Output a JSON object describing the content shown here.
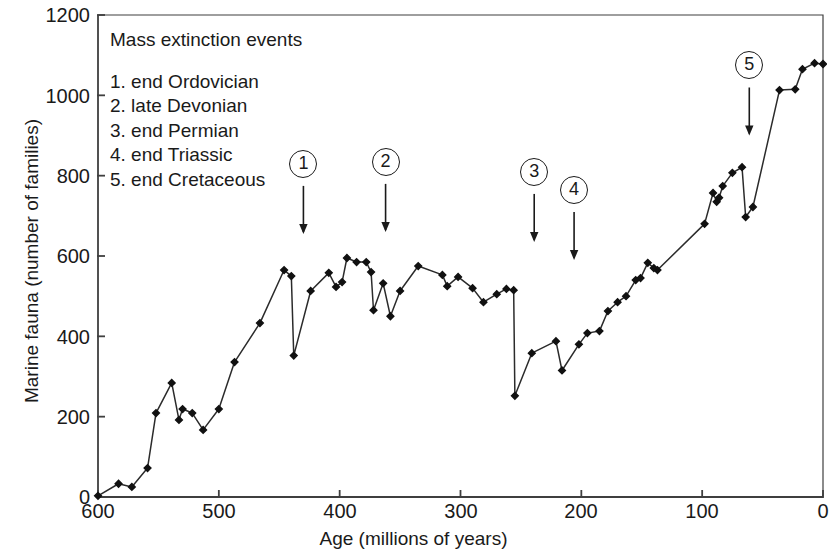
{
  "chart_data": {
    "type": "line",
    "title": "",
    "xlabel": "Age (millions of years)",
    "ylabel": "Marine fauna (number of families)",
    "xlim": [
      600,
      0
    ],
    "ylim": [
      0,
      1200
    ],
    "x_ticks": [
      600,
      500,
      400,
      300,
      200,
      100,
      0
    ],
    "y_ticks": [
      0,
      200,
      400,
      600,
      800,
      1000,
      1200
    ],
    "x_axis_reversed": true,
    "grid": false,
    "legend_position": "none",
    "marker": "diamond",
    "series": [
      {
        "name": "Marine fauna family diversity",
        "points": [
          [
            600,
            3
          ],
          [
            583,
            33
          ],
          [
            572,
            25
          ],
          [
            559,
            72
          ],
          [
            552,
            209
          ],
          [
            539,
            284
          ],
          [
            533,
            192
          ],
          [
            530,
            219
          ],
          [
            522,
            209
          ],
          [
            513,
            167
          ],
          [
            500,
            219
          ],
          [
            487,
            336
          ],
          [
            466,
            433
          ],
          [
            446,
            565
          ],
          [
            440,
            550
          ],
          [
            438,
            352
          ],
          [
            424,
            513
          ],
          [
            409,
            558
          ],
          [
            403,
            523
          ],
          [
            398,
            535
          ],
          [
            394,
            595
          ],
          [
            386,
            585
          ],
          [
            378,
            585
          ],
          [
            374,
            560
          ],
          [
            372,
            465
          ],
          [
            364,
            532
          ],
          [
            358,
            450
          ],
          [
            350,
            513
          ],
          [
            335,
            575
          ],
          [
            315,
            553
          ],
          [
            311,
            525
          ],
          [
            302,
            548
          ],
          [
            290,
            520
          ],
          [
            281,
            485
          ],
          [
            270,
            505
          ],
          [
            262,
            518
          ],
          [
            256,
            515
          ],
          [
            255,
            252
          ],
          [
            241,
            358
          ],
          [
            221,
            388
          ],
          [
            216,
            315
          ],
          [
            202,
            380
          ],
          [
            195,
            408
          ],
          [
            185,
            413
          ],
          [
            178,
            463
          ],
          [
            170,
            485
          ],
          [
            163,
            500
          ],
          [
            155,
            540
          ],
          [
            151,
            545
          ],
          [
            145,
            583
          ],
          [
            140,
            570
          ],
          [
            137,
            565
          ],
          [
            98,
            680
          ],
          [
            91,
            757
          ],
          [
            88,
            735
          ],
          [
            86,
            745
          ],
          [
            83,
            774
          ],
          [
            75,
            807
          ],
          [
            67,
            821
          ],
          [
            64,
            697
          ],
          [
            58,
            722
          ],
          [
            36,
            1013
          ],
          [
            23,
            1015
          ],
          [
            17,
            1065
          ],
          [
            7,
            1080
          ],
          [
            0,
            1078
          ]
        ]
      }
    ],
    "annotations": [
      {
        "id": "1",
        "label": "end Ordovician",
        "x": 430,
        "arrow_to_y": 660
      },
      {
        "id": "2",
        "label": "late Devonian",
        "x": 362,
        "arrow_to_y": 665
      },
      {
        "id": "3",
        "label": "end Permian",
        "x": 239,
        "arrow_to_y": 640
      },
      {
        "id": "4",
        "label": "end Triassic",
        "x": 206,
        "arrow_to_y": 595
      },
      {
        "id": "5",
        "label": "end Cretaceous",
        "x": 61,
        "arrow_to_y": 905
      }
    ]
  },
  "axes": {
    "ylabel": "Marine fauna (number of families)",
    "xlabel": "Age (millions of years)",
    "y_ticks": [
      "1200",
      "1000",
      "800",
      "600",
      "400",
      "200",
      "0"
    ],
    "x_ticks": [
      "600",
      "500",
      "400",
      "300",
      "200",
      "100",
      "0"
    ]
  },
  "legend": {
    "title": "Mass extinction events",
    "items": [
      "1. end Ordovician",
      "2. late Devonian",
      "3. end Permian",
      "4. end Triassic",
      "5. end Cretaceous"
    ]
  },
  "annotation_markers": [
    "1",
    "2",
    "3",
    "4",
    "5"
  ],
  "colors": {
    "axis": "#3f3f3f",
    "line": "#2b2b2b",
    "marker": "#111111",
    "text": "#1a1a1a",
    "background": "#ffffff"
  }
}
